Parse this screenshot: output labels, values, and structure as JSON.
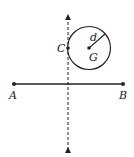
{
  "diagram": {
    "labels": {
      "A": "A",
      "B": "B",
      "C": "C",
      "G": "G",
      "d": "d"
    },
    "colors": {
      "stroke": "#222222",
      "background": "#ffffff"
    }
  }
}
